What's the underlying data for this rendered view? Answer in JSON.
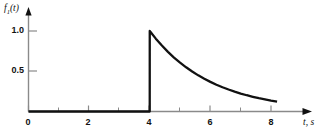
{
  "figure": {
    "background_color": "#ffffff",
    "line_color": "#111111",
    "axis_color": "#8a8a8a"
  },
  "axes": {
    "y_axis_label": "f",
    "y_axis_label_sub": "1",
    "y_axis_label_suffix": "(t)",
    "x_axis_label": "t, s",
    "y_ticks": [
      {
        "value": 1.0,
        "label": "1.0"
      },
      {
        "value": 0.5,
        "label": "0.5"
      }
    ],
    "x_ticks": [
      {
        "value": 0,
        "label": "0",
        "major": true
      },
      {
        "value": 1,
        "label": "",
        "major": false
      },
      {
        "value": 2,
        "label": "2",
        "major": true
      },
      {
        "value": 3,
        "label": "",
        "major": false
      },
      {
        "value": 4,
        "label": "4",
        "major": true
      },
      {
        "value": 5,
        "label": "",
        "major": false
      },
      {
        "value": 6,
        "label": "6",
        "major": true
      },
      {
        "value": 7,
        "label": "",
        "major": false
      },
      {
        "value": 8,
        "label": "8",
        "major": true
      }
    ]
  },
  "chart_data": {
    "type": "line",
    "title": "",
    "subtitle": "",
    "xlabel": "t, s",
    "ylabel": "f1(t)",
    "xlim": [
      0,
      9
    ],
    "ylim": [
      0,
      1.15
    ],
    "grid": false,
    "legend": null,
    "annotations": [
      "Zero for 0 <= t < 4",
      "Unit jump discontinuity at t = 4",
      "Exponential decay exp(-(t-4)/2) for t >= 4"
    ],
    "series": [
      {
        "name": "f1(t)",
        "color": "#111111",
        "x": [
          0.0,
          0.5,
          1.0,
          1.5,
          2.0,
          2.5,
          3.0,
          3.5,
          3.999,
          4.0,
          4.2,
          4.4,
          4.6,
          4.8,
          5.0,
          5.2,
          5.4,
          5.6,
          5.8,
          6.0,
          6.2,
          6.4,
          6.6,
          6.8,
          7.0,
          7.2,
          7.4,
          7.6,
          7.8,
          8.0,
          8.2
        ],
        "y": [
          0.0,
          0.0,
          0.0,
          0.0,
          0.0,
          0.0,
          0.0,
          0.0,
          0.0,
          1.0,
          0.905,
          0.819,
          0.741,
          0.67,
          0.607,
          0.549,
          0.497,
          0.449,
          0.407,
          0.368,
          0.333,
          0.301,
          0.273,
          0.247,
          0.223,
          0.202,
          0.183,
          0.165,
          0.15,
          0.135,
          0.122
        ]
      }
    ]
  }
}
